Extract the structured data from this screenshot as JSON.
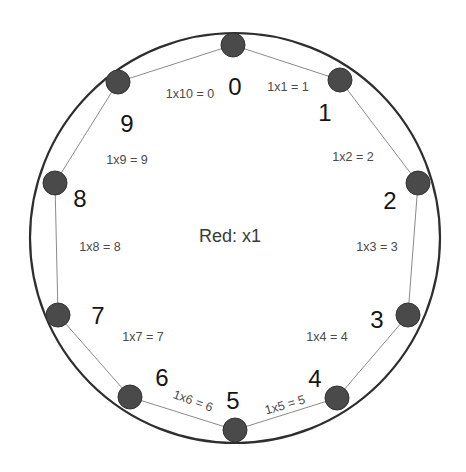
{
  "diagram": {
    "center_label": "Red: x1",
    "colors": {
      "circle": "#2e2e2e",
      "dot": "#4a4a4a",
      "edge": "#8a8a8a",
      "digit_text": "#151515",
      "product_text": "#4a4a4a"
    },
    "nodes": [
      {
        "digit": "0"
      },
      {
        "digit": "1"
      },
      {
        "digit": "2"
      },
      {
        "digit": "3"
      },
      {
        "digit": "4"
      },
      {
        "digit": "5"
      },
      {
        "digit": "6"
      },
      {
        "digit": "7"
      },
      {
        "digit": "8"
      },
      {
        "digit": "9"
      }
    ],
    "products": [
      {
        "text": "1x1 = 1"
      },
      {
        "text": "1x2 = 2"
      },
      {
        "text": "1x3 = 3"
      },
      {
        "text": "1x4 = 4"
      },
      {
        "text": "1x5 = 5"
      },
      {
        "text": "1x6 = 6"
      },
      {
        "text": "1x7 = 7"
      },
      {
        "text": "1x8 = 8"
      },
      {
        "text": "1x9 = 9"
      },
      {
        "text": "1x10 = 0"
      }
    ]
  }
}
